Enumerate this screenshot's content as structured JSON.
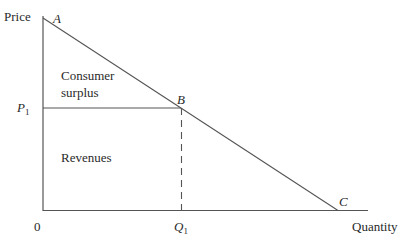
{
  "diagram": {
    "type": "demand-curve-consumer-surplus",
    "axes": {
      "y_label": "Price",
      "x_label": "Quantity",
      "origin_label": "0"
    },
    "points": {
      "A": "A",
      "B": "B",
      "C": "C"
    },
    "markers": {
      "p1": "P",
      "p1_sub": "1",
      "q1": "Q",
      "q1_sub": "1"
    },
    "regions": {
      "consumer_surplus_line1": "Consumer",
      "consumer_surplus_line2": "surplus",
      "revenues": "Revenues"
    },
    "colors": {
      "line": "#555555",
      "text": "#2a2a2a"
    }
  }
}
